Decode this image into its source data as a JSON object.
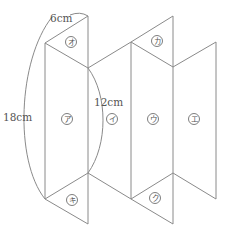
{
  "diagram": {
    "type": "net-of-triangular-prism",
    "dimensions": {
      "top_edge": "6cm",
      "height_arc": "18cm",
      "side_arc": "12cm"
    },
    "faces": {
      "a": "ア",
      "i": "イ",
      "u": "ウ",
      "e": "エ",
      "o": "オ",
      "ka": "カ",
      "ki": "キ",
      "ku": "ク"
    },
    "colors": {
      "line": "#8a8a8a",
      "text": "#555555"
    }
  }
}
